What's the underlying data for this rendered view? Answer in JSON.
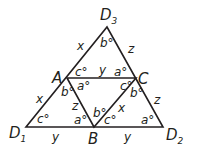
{
  "diagram": {
    "type": "geometry-triangle-subdivision",
    "stroke_color": "#231f20",
    "background": "#ffffff",
    "points": {
      "D1": {
        "x": 26,
        "y": 127
      },
      "D2": {
        "x": 163,
        "y": 127
      },
      "D3": {
        "x": 107,
        "y": 27
      },
      "A": {
        "x": 67,
        "y": 78
      },
      "B": {
        "x": 94,
        "y": 127
      },
      "C": {
        "x": 136,
        "y": 78
      }
    },
    "vertex_labels": {
      "D1": {
        "main": "D",
        "sub": "1"
      },
      "D2": {
        "main": "D",
        "sub": "2"
      },
      "D3": {
        "main": "D",
        "sub": "3"
      },
      "A": "A",
      "B": "B",
      "C": "C"
    },
    "side_labels": {
      "D3A": "x",
      "D3C": "z",
      "AC": "y",
      "AD1": "x",
      "AB": "z",
      "BC": "x",
      "CD2": "z",
      "D1B": "y",
      "BD2": "y"
    },
    "angle_labels": {
      "D3": "b°",
      "A_top": "c°",
      "C_top": "a°",
      "A_mid": "a°",
      "A_left": "b°",
      "C_mid": "c°",
      "C_right": "b°",
      "D1": "c°",
      "B_left": "a°",
      "B_mid": "b°",
      "B_right": "c°",
      "D2": "a°"
    }
  }
}
